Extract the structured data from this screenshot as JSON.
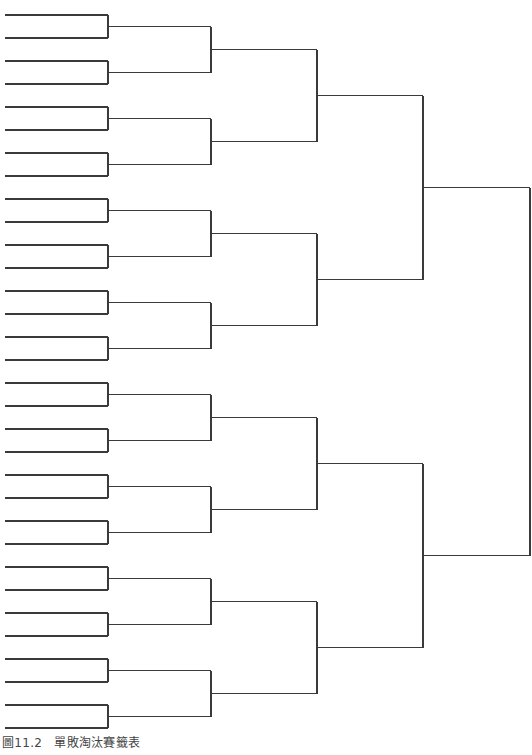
{
  "caption": {
    "figure_number": "圖11.2",
    "title": "單敗淘汰賽籤表"
  },
  "bracket": {
    "type": "single-elimination",
    "entrants": 32,
    "halves": 2,
    "line_color": "#3a3a3a",
    "rounds_x": [
      5,
      108,
      211,
      317,
      423,
      530
    ],
    "first_round_y": [
      15,
      38,
      61,
      84,
      107,
      130,
      153,
      176,
      199,
      222,
      245,
      268,
      291,
      314,
      337,
      360,
      383,
      406,
      429,
      452,
      475,
      498,
      521,
      544,
      567,
      590,
      613,
      636,
      659,
      682,
      705,
      728
    ]
  }
}
